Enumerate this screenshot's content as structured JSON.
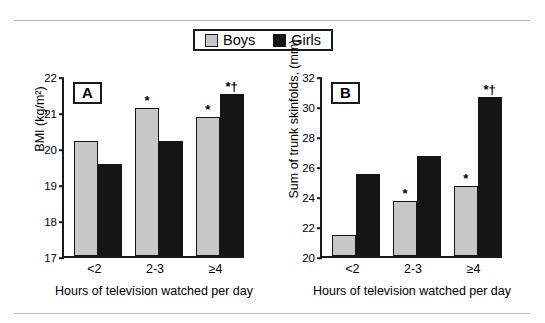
{
  "figure": {
    "legend": {
      "items": [
        {
          "label": "Boys",
          "color": "#c8c8c8",
          "swatch": "boys-swatch"
        },
        {
          "label": "Girls",
          "color": "#151515",
          "swatch": "girls-swatch"
        }
      ]
    }
  },
  "chart_data": [
    {
      "type": "bar",
      "panel_label": "A",
      "title": "",
      "categories": [
        "<2",
        "2-3",
        "≥4"
      ],
      "series": [
        {
          "name": "Boys",
          "values": [
            20.2,
            21.1,
            20.85
          ],
          "color": "#c8c8c8"
        },
        {
          "name": "Girls",
          "values": [
            19.55,
            20.2,
            21.5
          ],
          "color": "#151515"
        }
      ],
      "annotations": [
        {
          "series": "Boys",
          "category": "2-3",
          "text": "*"
        },
        {
          "series": "Boys",
          "category": "≥4",
          "text": "*"
        },
        {
          "series": "Girls",
          "category": "≥4",
          "text": "*†"
        }
      ],
      "xlabel": "Hours of television watched per day",
      "ylabel": "BMI (kg/m²)",
      "ylim": [
        17,
        22
      ],
      "yticks": [
        17,
        18,
        19,
        20,
        21,
        22
      ],
      "grid": false,
      "legend_position": "top-center"
    },
    {
      "type": "bar",
      "panel_label": "B",
      "title": "",
      "categories": [
        "<2",
        "2-3",
        "≥4"
      ],
      "series": [
        {
          "name": "Boys",
          "values": [
            21.4,
            23.7,
            24.7
          ],
          "color": "#c8c8c8"
        },
        {
          "name": "Girls",
          "values": [
            25.5,
            26.7,
            30.6
          ],
          "color": "#151515"
        }
      ],
      "annotations": [
        {
          "series": "Boys",
          "category": "2-3",
          "text": "*"
        },
        {
          "series": "Boys",
          "category": "≥4",
          "text": "*"
        },
        {
          "series": "Girls",
          "category": "≥4",
          "text": "*†"
        }
      ],
      "xlabel": "Hours of television watched per day",
      "ylabel": "Sum of trunk skinfolds, (mm)",
      "ylim": [
        20,
        32
      ],
      "yticks": [
        20,
        22,
        24,
        26,
        28,
        30,
        32
      ],
      "grid": false,
      "legend_position": "top-center"
    }
  ]
}
